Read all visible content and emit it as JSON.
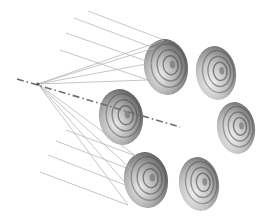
{
  "diagram": {
    "colors": {
      "background": "#ffffff",
      "disc_dark": "#5a5a5a",
      "disc_light": "#e6e6e6",
      "ray": "#b8b8b8",
      "axis": "#6e6e6e"
    },
    "focal_point": {
      "x": 38,
      "y": 84
    },
    "axis": {
      "x1": 17,
      "y1": 79,
      "x2": 180,
      "y2": 127,
      "style": "dash-dot"
    },
    "discs": [
      {
        "id": "top-left",
        "cx": 166,
        "cy": 67,
        "rx": 22,
        "ry": 28,
        "has_rays": true
      },
      {
        "id": "top-right",
        "cx": 216,
        "cy": 73,
        "rx": 20,
        "ry": 27,
        "has_rays": false
      },
      {
        "id": "middle-left",
        "cx": 121,
        "cy": 117,
        "rx": 22,
        "ry": 28,
        "has_rays": false
      },
      {
        "id": "middle-right",
        "cx": 236,
        "cy": 128,
        "rx": 19,
        "ry": 26,
        "has_rays": false
      },
      {
        "id": "bottom-left",
        "cx": 146,
        "cy": 180,
        "rx": 22,
        "ry": 28,
        "has_rays": true
      },
      {
        "id": "bottom-right",
        "cx": 199,
        "cy": 184,
        "rx": 20,
        "ry": 27,
        "has_rays": false
      }
    ],
    "rays": [
      {
        "from": [
          88,
          11
        ],
        "hit": [
          164,
          40
        ]
      },
      {
        "from": [
          74,
          18
        ],
        "hit": [
          154,
          48
        ]
      },
      {
        "from": [
          66,
          33
        ],
        "hit": [
          152,
          63
        ]
      },
      {
        "from": [
          60,
          50
        ],
        "hit": [
          148,
          80
        ]
      },
      {
        "from": [
          66,
          130
        ],
        "hit": [
          136,
          156
        ]
      },
      {
        "from": [
          56,
          141
        ],
        "hit": [
          132,
          170
        ]
      },
      {
        "from": [
          48,
          155
        ],
        "hit": [
          128,
          186
        ]
      },
      {
        "from": [
          40,
          172
        ],
        "hit": [
          128,
          205
        ]
      }
    ]
  }
}
